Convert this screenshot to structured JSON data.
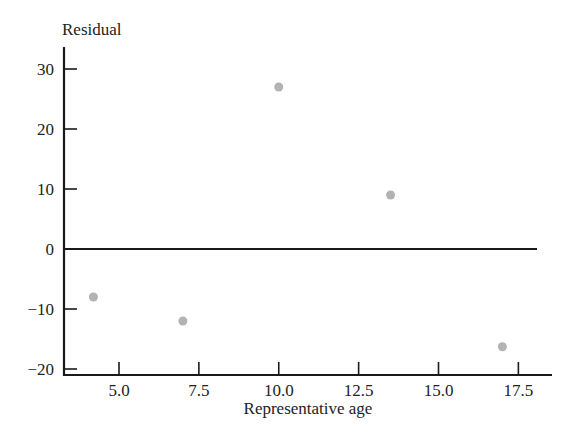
{
  "chart_data": {
    "type": "scatter",
    "title": "",
    "xlabel": "Representative age",
    "ylabel": "Residual",
    "xlim": [
      3.2,
      18.2
    ],
    "ylim": [
      -21,
      34
    ],
    "x_ticks": [
      5.0,
      7.5,
      10.0,
      12.5,
      15.0,
      17.5
    ],
    "x_tick_labels": [
      "5.0",
      "7.5",
      "10.0",
      "12.5",
      "15.0",
      "17.5"
    ],
    "y_ticks": [
      -20,
      -10,
      0,
      10,
      20,
      30
    ],
    "y_tick_labels": [
      "−20",
      "−10",
      "0",
      "10",
      "20",
      "30"
    ],
    "grid": false,
    "legend": null,
    "reference_line": {
      "y": 0
    },
    "series": [
      {
        "name": "Residuals",
        "color": "#b3b3b3",
        "x": [
          4.2,
          7.0,
          10.0,
          13.5,
          17.0
        ],
        "y": [
          -8,
          -12,
          27,
          9,
          -16.3
        ]
      }
    ]
  }
}
